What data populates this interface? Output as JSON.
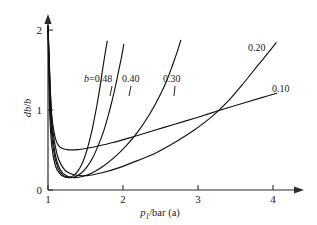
{
  "chart_data": {
    "type": "line",
    "title": "",
    "subtitle": "",
    "xlabel": "p1/bar (a)",
    "xlabel_parts": {
      "symbol": "p",
      "subscript": "1",
      "rest": "/bar (a)"
    },
    "ylabel": "db/b",
    "ylabel_parts": {
      "numerator": "d",
      "symbol": "b",
      "denominator": "b"
    },
    "xlim": [
      1,
      4.15
    ],
    "ylim": [
      0,
      2.1
    ],
    "xticks": [
      1,
      2,
      3,
      4
    ],
    "xtick_labels": [
      "1",
      "2",
      "3",
      "4"
    ],
    "yticks": [
      0,
      1,
      2
    ],
    "ytick_labels": [
      "0",
      "1",
      "2"
    ],
    "grid": false,
    "legend_position": "inline-curve-labels",
    "series_label_prefix": "b=",
    "series": [
      {
        "name": "0.48",
        "label": "b=0.48",
        "inline_label": "0.48",
        "b": 0.48,
        "x": [
          1.0,
          1.02,
          1.05,
          1.1,
          1.16,
          1.22,
          1.28,
          1.34,
          1.4,
          1.46,
          1.52,
          1.58,
          1.62,
          1.66,
          1.7,
          1.73,
          1.76,
          1.79
        ],
        "y": [
          2.05,
          1.05,
          0.55,
          0.3,
          0.2,
          0.165,
          0.16,
          0.18,
          0.24,
          0.34,
          0.5,
          0.72,
          0.9,
          1.1,
          1.33,
          1.52,
          1.7,
          1.86
        ]
      },
      {
        "name": "0.40",
        "label": "0.40",
        "inline_label": "0.40",
        "b": 0.4,
        "x": [
          1.0,
          1.03,
          1.07,
          1.13,
          1.2,
          1.28,
          1.36,
          1.44,
          1.52,
          1.6,
          1.68,
          1.74,
          1.8,
          1.85,
          1.9,
          1.94,
          1.98,
          2.01
        ],
        "y": [
          2.05,
          1.0,
          0.52,
          0.28,
          0.185,
          0.155,
          0.165,
          0.21,
          0.29,
          0.41,
          0.58,
          0.73,
          0.92,
          1.1,
          1.3,
          1.48,
          1.66,
          1.82
        ]
      },
      {
        "name": "0.30",
        "label": "0.30",
        "inline_label": "0.30",
        "b": 0.3,
        "x": [
          1.0,
          1.04,
          1.09,
          1.16,
          1.25,
          1.36,
          1.48,
          1.6,
          1.74,
          1.9,
          2.05,
          2.2,
          2.35,
          2.48,
          2.58,
          2.66,
          2.72,
          2.77
        ],
        "y": [
          2.05,
          0.95,
          0.48,
          0.26,
          0.175,
          0.155,
          0.175,
          0.22,
          0.3,
          0.42,
          0.56,
          0.73,
          0.94,
          1.16,
          1.36,
          1.56,
          1.72,
          1.87
        ]
      },
      {
        "name": "0.20",
        "label": "0.20",
        "inline_label": "0.20",
        "b": 0.2,
        "x": [
          1.0,
          1.05,
          1.12,
          1.22,
          1.35,
          1.52,
          1.72,
          1.95,
          2.2,
          2.45,
          2.7,
          2.95,
          3.2,
          3.42,
          3.62,
          3.8,
          3.94,
          4.04
        ],
        "y": [
          2.05,
          0.9,
          0.45,
          0.255,
          0.19,
          0.18,
          0.215,
          0.28,
          0.37,
          0.47,
          0.6,
          0.75,
          0.93,
          1.13,
          1.35,
          1.56,
          1.72,
          1.84
        ]
      },
      {
        "name": "0.10",
        "label": "0.10",
        "inline_label": "0.10",
        "b": 0.1,
        "x": [
          1.0,
          1.04,
          1.09,
          1.15,
          1.25,
          1.4,
          1.6,
          1.85,
          2.1,
          2.4,
          2.7,
          3.0,
          3.3,
          3.6,
          3.85,
          4.05
        ],
        "y": [
          2.05,
          1.05,
          0.68,
          0.545,
          0.505,
          0.505,
          0.535,
          0.59,
          0.655,
          0.74,
          0.825,
          0.91,
          1.0,
          1.085,
          1.155,
          1.21
        ]
      }
    ],
    "annotations": [
      {
        "text": "b=0.48",
        "x": 1.58,
        "y": 1.42
      },
      {
        "text": "0.40",
        "x": 1.88,
        "y": 1.42
      },
      {
        "text": "0.30",
        "x": 2.5,
        "y": 1.44
      },
      {
        "text": "0.20",
        "x": 3.62,
        "y": 1.78
      },
      {
        "text": "0.10",
        "x": 3.88,
        "y": 1.3
      }
    ],
    "colors": {
      "curve": "#111111",
      "axis": "#2b2b2b",
      "background": "#ffffff"
    }
  }
}
